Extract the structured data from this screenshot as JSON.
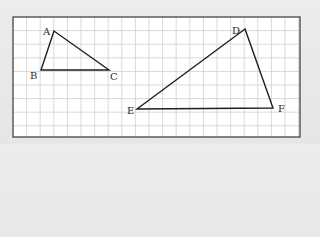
{
  "diagram": {
    "type": "grid-geometry",
    "colors": {
      "background": "#e8e8e8",
      "paper": "#ffffff",
      "grid": "#cfcfcf",
      "frame": "#444444",
      "stroke": "#1e1e1e"
    },
    "frame": {
      "x": 13,
      "y": 17,
      "width": 287,
      "height": 120
    },
    "grid": {
      "spacing": 13.6
    },
    "triangles": [
      {
        "name": "ABC",
        "vertices": [
          {
            "label": "A",
            "x": 54,
            "y": 31,
            "lx": 43,
            "ly": 35
          },
          {
            "label": "B",
            "x": 41,
            "y": 70,
            "lx": 30,
            "ly": 79
          },
          {
            "label": "C",
            "x": 109,
            "y": 70,
            "lx": 110,
            "ly": 80
          }
        ]
      },
      {
        "name": "DEF",
        "vertices": [
          {
            "label": "D",
            "x": 245,
            "y": 29,
            "lx": 232,
            "ly": 34
          },
          {
            "label": "E",
            "x": 137,
            "y": 109,
            "lx": 127,
            "ly": 114
          },
          {
            "label": "F",
            "x": 273,
            "y": 108,
            "lx": 278,
            "ly": 112
          }
        ]
      }
    ]
  }
}
